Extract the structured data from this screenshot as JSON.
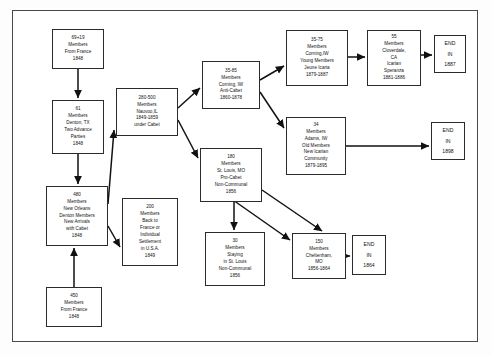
{
  "diagram": {
    "frame_color": "#4a4a4a",
    "node_border_color": "#2b2b2b",
    "edge_color": "#111111",
    "background": "#ffffff",
    "nodes": [
      {
        "id": "france-1848-a",
        "name": "france-first-group",
        "lines": [
          "69+19",
          "Members",
          "From France",
          "1848"
        ],
        "x": 52,
        "y": 29,
        "w": 52,
        "h": 40
      },
      {
        "id": "denton-tx",
        "name": "denton-texas-advance-parties",
        "lines": [
          "61",
          "Members",
          "Denton, TX",
          "Two Advance",
          "Parties",
          "1848"
        ],
        "x": 52,
        "y": 100,
        "w": 52,
        "h": 54
      },
      {
        "id": "new-orleans",
        "name": "new-orleans-regroup",
        "lines": [
          "480",
          "Members",
          "New Orleans",
          "Denton Members",
          "New Arrivals",
          "with Cabet",
          "1848"
        ],
        "x": 46,
        "y": 186,
        "w": 62,
        "h": 60
      },
      {
        "id": "france-1848-b",
        "name": "france-second-group",
        "lines": [
          "450",
          "Members",
          "From France",
          "1848"
        ],
        "x": 46,
        "y": 287,
        "w": 56,
        "h": 40
      },
      {
        "id": "nauvoo",
        "name": "nauvoo-illinois-colony",
        "lines": [
          "280-500",
          "Members",
          "Nauvoo,IL",
          "1849-1859",
          "under Cabet"
        ],
        "x": 116,
        "y": 88,
        "w": 62,
        "h": 48
      },
      {
        "id": "back-to-france",
        "name": "back-to-france-or-individual-settlement",
        "lines": [
          "200",
          "Members",
          "Back to",
          "France or",
          "Individual",
          "Settlement",
          "in U.S.A.",
          "1849"
        ],
        "x": 122,
        "y": 198,
        "w": 56,
        "h": 68
      },
      {
        "id": "corning-anti-cabet",
        "name": "corning-iowa-anti-cabet",
        "lines": [
          "35-85",
          "Members",
          "Corning, IW",
          "Anti-Cabet",
          "1860-1878"
        ],
        "x": 202,
        "y": 61,
        "w": 58,
        "h": 48
      },
      {
        "id": "st-louis",
        "name": "st-louis-pro-cabet",
        "lines": [
          "180",
          "Members",
          "St. Louis, MO",
          "Pro-Cabet",
          "Non-Communal",
          "1856"
        ],
        "x": 200,
        "y": 148,
        "w": 62,
        "h": 54
      },
      {
        "id": "staying-st-louis",
        "name": "staying-in-st-louis",
        "lines": [
          "30",
          "Members",
          "Staying",
          "in St. Louis",
          "Non-Communal",
          "1856"
        ],
        "x": 205,
        "y": 232,
        "w": 60,
        "h": 54
      },
      {
        "id": "cheltenham",
        "name": "cheltenham-missouri",
        "lines": [
          "150",
          "Members",
          "Cheltenham,",
          "MO",
          "1856-1864"
        ],
        "x": 292,
        "y": 233,
        "w": 54,
        "h": 46
      },
      {
        "id": "jeune-icarie",
        "name": "corning-young-members-jeune-icaria",
        "lines": [
          "35-75",
          "Members",
          "Corning,IW",
          "Young Members",
          "Jeune Icaria",
          "1879-1887"
        ],
        "x": 286,
        "y": 30,
        "w": 62,
        "h": 56
      },
      {
        "id": "new-icarian",
        "name": "adams-old-members-new-icarian-community",
        "lines": [
          "34",
          "Members",
          "Adams, IW",
          "Old Members",
          "New Icarian",
          "Community",
          "1879-1895"
        ],
        "x": 286,
        "y": 117,
        "w": 60,
        "h": 58
      },
      {
        "id": "cloverdale",
        "name": "cloverdale-california-icarian-speranza",
        "lines": [
          "55",
          "Members",
          "Cloverdale,",
          "CA",
          "Icarian",
          "Speranza",
          "1881-1886"
        ],
        "x": 367,
        "y": 30,
        "w": 54,
        "h": 56
      },
      {
        "id": "end-1887",
        "name": "end-in-1887",
        "lines": [
          "END",
          "IN",
          "1887"
        ],
        "x": 434,
        "y": 35,
        "w": 32,
        "h": 38,
        "terminal": true
      },
      {
        "id": "end-1898",
        "name": "end-in-1898",
        "lines": [
          "END",
          "IN",
          "1898"
        ],
        "x": 431,
        "y": 122,
        "w": 34,
        "h": 38,
        "terminal": true
      },
      {
        "id": "end-1864",
        "name": "end-in-1864",
        "lines": [
          "END",
          "IN",
          "1864"
        ],
        "x": 352,
        "y": 235,
        "w": 34,
        "h": 40,
        "terminal": true
      }
    ],
    "edges": [
      {
        "name": "edge-france-to-denton",
        "from": "france-1848-a",
        "to": "denton-tx",
        "points": [
          [
            78,
            69
          ],
          [
            78,
            98
          ]
        ]
      },
      {
        "name": "edge-denton-to-new-orleans",
        "from": "denton-tx",
        "to": "new-orleans",
        "points": [
          [
            78,
            154
          ],
          [
            78,
            184
          ]
        ]
      },
      {
        "name": "edge-france2-to-new-orleans",
        "from": "france-1848-b",
        "to": "new-orleans",
        "points": [
          [
            74,
            287
          ],
          [
            74,
            248
          ]
        ]
      },
      {
        "name": "edge-new-orleans-to-nauvoo",
        "from": "new-orleans",
        "to": "nauvoo",
        "points": [
          [
            108,
            204
          ],
          [
            114,
            130
          ]
        ]
      },
      {
        "name": "edge-new-orleans-to-back-to-france",
        "from": "new-orleans",
        "to": "back-to-france",
        "points": [
          [
            108,
            226
          ],
          [
            120,
            247
          ]
        ]
      },
      {
        "name": "edge-nauvoo-to-corning",
        "from": "nauvoo",
        "to": "corning-anti-cabet",
        "points": [
          [
            178,
            108
          ],
          [
            200,
            88
          ]
        ]
      },
      {
        "name": "edge-nauvoo-to-st-louis",
        "from": "nauvoo",
        "to": "st-louis",
        "points": [
          [
            178,
            120
          ],
          [
            198,
            158
          ]
        ]
      },
      {
        "name": "edge-corning-to-jeune-icarie",
        "from": "corning-anti-cabet",
        "to": "jeune-icarie",
        "points": [
          [
            260,
            80
          ],
          [
            284,
            66
          ]
        ]
      },
      {
        "name": "edge-corning-to-new-icarian",
        "from": "corning-anti-cabet",
        "to": "new-icarian",
        "points": [
          [
            260,
            92
          ],
          [
            284,
            128
          ]
        ]
      },
      {
        "name": "edge-jeune-icarie-to-cloverdale",
        "from": "jeune-icarie",
        "to": "cloverdale",
        "points": [
          [
            348,
            57
          ],
          [
            365,
            57
          ]
        ]
      },
      {
        "name": "edge-cloverdale-to-end-1887",
        "from": "cloverdale",
        "to": "end-1887",
        "points": [
          [
            421,
            55
          ],
          [
            432,
            55
          ]
        ]
      },
      {
        "name": "edge-new-icarian-to-end-1898",
        "from": "new-icarian",
        "to": "end-1898",
        "points": [
          [
            346,
            146
          ],
          [
            429,
            146
          ]
        ]
      },
      {
        "name": "edge-st-louis-to-staying",
        "from": "st-louis",
        "to": "staying-st-louis",
        "points": [
          [
            234,
            202
          ],
          [
            234,
            230
          ]
        ]
      },
      {
        "name": "edge-st-louis-to-cheltenham",
        "from": "st-louis",
        "to": "cheltenham",
        "points": [
          [
            233,
            200
          ],
          [
            290,
            240
          ]
        ]
      },
      {
        "name": "edge-st-louis-right-to-cheltenham",
        "from": "st-louis",
        "to": "cheltenham",
        "points": [
          [
            262,
            190
          ],
          [
            322,
            231
          ]
        ]
      },
      {
        "name": "edge-cheltenham-to-end-1864",
        "from": "cheltenham",
        "to": "end-1864",
        "points": [
          [
            346,
            256
          ],
          [
            350,
            256
          ]
        ]
      }
    ]
  }
}
